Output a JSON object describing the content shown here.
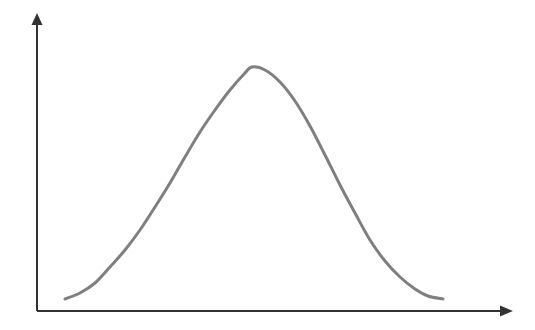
{
  "figure": {
    "title": "",
    "background_color": "#ffffff",
    "width": 535,
    "height": 330
  },
  "axes": {
    "color": "#333333",
    "stroke_width": 2,
    "x_axis": {
      "name": "x-axis",
      "label": "",
      "start_x": 37,
      "end_x": 503,
      "y": 311,
      "arrow_tip_x": 513,
      "arrow_head": "solid-triangle-right"
    },
    "y_axis": {
      "name": "y-axis",
      "label": "",
      "x": 37,
      "start_y": 311,
      "end_y": 22,
      "arrow_tip_y": 13,
      "arrow_head": "solid-triangle-up"
    }
  },
  "curve": {
    "name": "bell-curve",
    "color": "#7f7f80",
    "stroke_width": 3,
    "line_cap": "round",
    "shape": "gaussian-bell"
  },
  "chart_data": {
    "type": "line",
    "title": "",
    "subtitle": "",
    "xlabel": "",
    "ylabel": "",
    "grid": false,
    "legend": null,
    "xlim": [
      37,
      513
    ],
    "ylim": [
      311,
      13
    ],
    "annotations": [],
    "series": [
      {
        "name": "bell-curve",
        "color": "#7f7f80",
        "points": [
          [
            65,
            299
          ],
          [
            80,
            293
          ],
          [
            95,
            283
          ],
          [
            110,
            267
          ],
          [
            125,
            250
          ],
          [
            140,
            230
          ],
          [
            155,
            207
          ],
          [
            170,
            183
          ],
          [
            185,
            157
          ],
          [
            200,
            132
          ],
          [
            215,
            110
          ],
          [
            230,
            90
          ],
          [
            245,
            73
          ],
          [
            252,
            67
          ],
          [
            265,
            70
          ],
          [
            280,
            82
          ],
          [
            295,
            101
          ],
          [
            310,
            126
          ],
          [
            325,
            155
          ],
          [
            340,
            185
          ],
          [
            355,
            213
          ],
          [
            370,
            240
          ],
          [
            385,
            261
          ],
          [
            400,
            277
          ],
          [
            415,
            289
          ],
          [
            428,
            296
          ],
          [
            443,
            299
          ]
        ]
      }
    ]
  }
}
